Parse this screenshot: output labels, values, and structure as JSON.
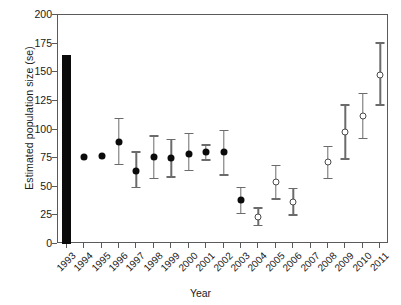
{
  "chart_data": {
    "type": "scatter",
    "title": "",
    "xlabel": "Year",
    "ylabel": "Estimated population size (se)",
    "ylim": [
      0,
      200
    ],
    "yticks": [
      0,
      25,
      50,
      75,
      100,
      125,
      150,
      175,
      200
    ],
    "grid": false,
    "legend": "none",
    "categories": [
      "1993",
      "1994",
      "1995",
      "1996",
      "1997",
      "1998",
      "1999",
      "2000",
      "2001",
      "2002",
      "2003",
      "2004",
      "2005",
      "2006",
      "2007",
      "2008",
      "2009",
      "2010",
      "2011"
    ],
    "series": [
      {
        "name": "Census count (bar)",
        "marker": "bar",
        "points": [
          {
            "x": "1993",
            "y": 165
          }
        ]
      },
      {
        "name": "Estimate (closed circle)",
        "marker": "filled-circle",
        "points": [
          {
            "x": "1994",
            "y": 76,
            "lo": 76,
            "hi": 76
          },
          {
            "x": "1995",
            "y": 77,
            "lo": 77,
            "hi": 77
          },
          {
            "x": "1996",
            "y": 89,
            "lo": 70,
            "hi": 110
          },
          {
            "x": "1997",
            "y": 64,
            "lo": 50,
            "hi": 81
          },
          {
            "x": "1998",
            "y": 76,
            "lo": 58,
            "hi": 95
          },
          {
            "x": "1999",
            "y": 75,
            "lo": 59,
            "hi": 92
          },
          {
            "x": "2000",
            "y": 79,
            "lo": 65,
            "hi": 97
          },
          {
            "x": "2001",
            "y": 80,
            "lo": 74,
            "hi": 87
          },
          {
            "x": "2002",
            "y": 80,
            "lo": 61,
            "hi": 100
          },
          {
            "x": "2003",
            "y": 38,
            "lo": 27,
            "hi": 50
          }
        ]
      },
      {
        "name": "Estimate (open circle)",
        "marker": "open-circle",
        "points": [
          {
            "x": "2004",
            "y": 24,
            "lo": 17,
            "hi": 32
          },
          {
            "x": "2005",
            "y": 54,
            "lo": 40,
            "hi": 69
          },
          {
            "x": "2006",
            "y": 37,
            "lo": 26,
            "hi": 49
          },
          {
            "x": "2008",
            "y": 72,
            "lo": 58,
            "hi": 86
          },
          {
            "x": "2009",
            "y": 98,
            "lo": 75,
            "hi": 122
          },
          {
            "x": "2010",
            "y": 112,
            "lo": 93,
            "hi": 132
          },
          {
            "x": "2011",
            "y": 148,
            "lo": 122,
            "hi": 176
          }
        ]
      }
    ]
  }
}
